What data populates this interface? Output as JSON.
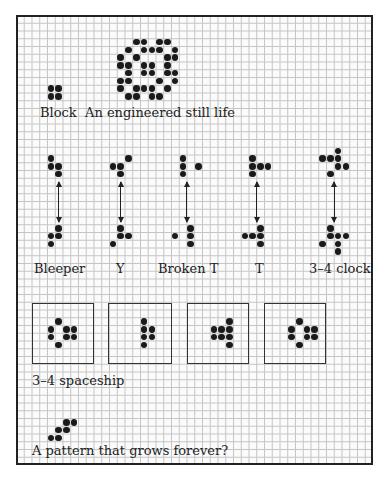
{
  "grid": {
    "origin_x": 16,
    "origin_y": 15,
    "cell": 7.76,
    "cols": 46,
    "rows": 58
  },
  "labels": {
    "block": "Block",
    "still_life": "An engineered still life",
    "bleeper": "Bleeper",
    "y": "Y",
    "broken_t": "Broken T",
    "t": "T",
    "clock": "3–4 clock",
    "spaceship": "3–4 spaceship",
    "grows": "A pattern that grows forever?"
  },
  "patterns": {
    "block": [
      [
        9,
        4
      ],
      [
        9,
        5
      ],
      [
        10,
        4
      ],
      [
        10,
        5
      ]
    ],
    "still_life": [
      [
        3,
        15
      ],
      [
        3,
        16
      ],
      [
        3,
        18
      ],
      [
        3,
        19
      ],
      [
        4,
        14
      ],
      [
        4,
        16
      ],
      [
        4,
        17
      ],
      [
        4,
        18
      ],
      [
        4,
        20
      ],
      [
        5,
        13
      ],
      [
        5,
        15
      ],
      [
        5,
        19
      ],
      [
        5,
        20
      ],
      [
        6,
        13
      ],
      [
        6,
        14
      ],
      [
        6,
        16
      ],
      [
        6,
        17
      ],
      [
        6,
        19
      ],
      [
        7,
        14
      ],
      [
        7,
        16
      ],
      [
        7,
        17
      ],
      [
        7,
        19
      ],
      [
        7,
        20
      ],
      [
        8,
        13
      ],
      [
        8,
        14
      ],
      [
        8,
        18
      ],
      [
        8,
        20
      ],
      [
        9,
        13
      ],
      [
        9,
        15
      ],
      [
        9,
        16
      ],
      [
        9,
        17
      ],
      [
        9,
        19
      ],
      [
        10,
        14
      ],
      [
        10,
        15
      ],
      [
        10,
        17
      ],
      [
        10,
        18
      ]
    ],
    "oscillators": [
      {
        "name": "bleeper",
        "top": [
          [
            18,
            4
          ],
          [
            19,
            4
          ],
          [
            19,
            5
          ],
          [
            20,
            5
          ]
        ],
        "bottom": [
          [
            27,
            5
          ],
          [
            28,
            4
          ],
          [
            28,
            5
          ],
          [
            29,
            4
          ]
        ],
        "arrow_col": 5
      },
      {
        "name": "y",
        "top": [
          [
            18,
            14
          ],
          [
            19,
            12
          ],
          [
            19,
            13
          ],
          [
            20,
            13
          ]
        ],
        "bottom": [
          [
            27,
            13
          ],
          [
            28,
            13
          ],
          [
            28,
            14
          ],
          [
            29,
            12
          ]
        ],
        "arrow_col": 13
      },
      {
        "name": "broken-t",
        "top": [
          [
            18,
            21
          ],
          [
            19,
            21
          ],
          [
            20,
            21
          ],
          [
            19,
            23
          ]
        ],
        "bottom": [
          [
            27,
            22
          ],
          [
            28,
            22
          ],
          [
            29,
            22
          ],
          [
            28,
            20
          ]
        ],
        "arrow_col": 21.5
      },
      {
        "name": "t",
        "top": [
          [
            18,
            30
          ],
          [
            19,
            30
          ],
          [
            19,
            31
          ],
          [
            19,
            32
          ],
          [
            20,
            30
          ]
        ],
        "bottom": [
          [
            27,
            31
          ],
          [
            28,
            29
          ],
          [
            28,
            30
          ],
          [
            28,
            31
          ],
          [
            29,
            31
          ]
        ],
        "arrow_col": 30.5
      },
      {
        "name": "clock",
        "top": [
          [
            17,
            41
          ],
          [
            18,
            39
          ],
          [
            18,
            40
          ],
          [
            18,
            41
          ],
          [
            19,
            41
          ],
          [
            19,
            42
          ],
          [
            20,
            40
          ]
        ],
        "bottom": [
          [
            27,
            40
          ],
          [
            28,
            40
          ],
          [
            28,
            41
          ],
          [
            28,
            42
          ],
          [
            29,
            39
          ],
          [
            29,
            41
          ],
          [
            30,
            41
          ]
        ],
        "arrow_col": 40.5
      }
    ],
    "spaceship_frames": [
      {
        "box": [
          32,
          303,
          62,
          61
        ],
        "cells": [
          [
            39,
            5
          ],
          [
            40,
            4
          ],
          [
            40,
            6
          ],
          [
            40,
            7
          ],
          [
            41,
            4
          ],
          [
            41,
            6
          ],
          [
            41,
            7
          ],
          [
            42,
            5
          ]
        ]
      },
      {
        "box": [
          108,
          303,
          64,
          61
        ],
        "cells": [
          [
            39,
            16
          ],
          [
            40,
            16
          ],
          [
            40,
            17
          ],
          [
            41,
            16
          ],
          [
            41,
            17
          ],
          [
            42,
            16
          ]
        ]
      },
      {
        "box": [
          187,
          303,
          62,
          61
        ],
        "cells": [
          [
            39,
            27
          ],
          [
            40,
            25
          ],
          [
            40,
            26
          ],
          [
            40,
            27
          ],
          [
            41,
            25
          ],
          [
            41,
            26
          ],
          [
            41,
            27
          ],
          [
            42,
            27
          ]
        ]
      },
      {
        "box": [
          264,
          303,
          62,
          61
        ],
        "cells": [
          [
            39,
            36
          ],
          [
            40,
            35
          ],
          [
            40,
            37
          ],
          [
            40,
            38
          ],
          [
            41,
            35
          ],
          [
            41,
            37
          ],
          [
            41,
            38
          ],
          [
            42,
            36
          ]
        ]
      }
    ],
    "grows": [
      [
        52,
        6
      ],
      [
        52,
        7
      ],
      [
        53,
        5
      ],
      [
        53,
        6
      ],
      [
        54,
        4
      ],
      [
        54,
        5
      ]
    ]
  },
  "arrows": {
    "top_y": 182,
    "bottom_y": 222
  }
}
